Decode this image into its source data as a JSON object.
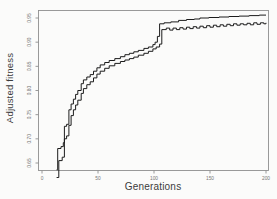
{
  "figure": {
    "xlabel": "Generations",
    "ylabel": "Adjusted fitness"
  },
  "chart_data": {
    "type": "line",
    "title": "",
    "xlabel": "Generations",
    "ylabel": "Adjusted fitness",
    "xlim": [
      0,
      200
    ],
    "ylim": [
      0.62,
      0.97
    ],
    "x_ticks": [
      "0",
      "50",
      "100",
      "150",
      "200"
    ],
    "y_ticks": [
      "0.65",
      "0.70",
      "0.75",
      "0.80",
      "0.85",
      "0.90",
      "0.95"
    ],
    "grid": false,
    "legend_position": "none",
    "interpolation": "step-after",
    "line_color": "#1c1c1c",
    "box_color": "#8f8f8f",
    "tick_label_color": "#777777",
    "series": [
      {
        "name": "best-fitness",
        "points": [
          [
            13,
            0.636
          ],
          [
            14,
            0.68
          ],
          [
            17,
            0.684
          ],
          [
            19,
            0.692
          ],
          [
            20,
            0.726
          ],
          [
            22,
            0.73
          ],
          [
            24,
            0.76
          ],
          [
            26,
            0.772
          ],
          [
            28,
            0.782
          ],
          [
            30,
            0.792
          ],
          [
            32,
            0.8
          ],
          [
            35,
            0.814
          ],
          [
            37,
            0.822
          ],
          [
            40,
            0.828
          ],
          [
            43,
            0.833
          ],
          [
            46,
            0.84
          ],
          [
            49,
            0.847
          ],
          [
            52,
            0.853
          ],
          [
            56,
            0.858
          ],
          [
            60,
            0.862
          ],
          [
            65,
            0.866
          ],
          [
            70,
            0.87
          ],
          [
            74,
            0.874
          ],
          [
            78,
            0.877
          ],
          [
            82,
            0.88
          ],
          [
            86,
            0.883
          ],
          [
            91,
            0.887
          ],
          [
            95,
            0.89
          ],
          [
            99,
            0.895
          ],
          [
            101,
            0.9
          ],
          [
            103,
            0.912
          ],
          [
            105,
            0.938
          ],
          [
            109,
            0.94
          ],
          [
            115,
            0.942
          ],
          [
            122,
            0.945
          ],
          [
            129,
            0.947
          ],
          [
            136,
            0.948
          ],
          [
            141,
            0.95
          ],
          [
            149,
            0.951
          ],
          [
            158,
            0.952
          ],
          [
            167,
            0.953
          ],
          [
            176,
            0.954
          ],
          [
            185,
            0.955
          ],
          [
            194,
            0.956
          ],
          [
            200,
            0.956
          ]
        ]
      },
      {
        "name": "mean-fitness",
        "points": [
          [
            13,
            0.62
          ],
          [
            15,
            0.655
          ],
          [
            18,
            0.662
          ],
          [
            20,
            0.7
          ],
          [
            22,
            0.706
          ],
          [
            24,
            0.728
          ],
          [
            26,
            0.748
          ],
          [
            28,
            0.76
          ],
          [
            30,
            0.77
          ],
          [
            32,
            0.78
          ],
          [
            35,
            0.794
          ],
          [
            37,
            0.804
          ],
          [
            40,
            0.812
          ],
          [
            43,
            0.818
          ],
          [
            46,
            0.826
          ],
          [
            49,
            0.834
          ],
          [
            52,
            0.84
          ],
          [
            56,
            0.846
          ],
          [
            60,
            0.851
          ],
          [
            65,
            0.856
          ],
          [
            70,
            0.86
          ],
          [
            74,
            0.863
          ],
          [
            78,
            0.866
          ],
          [
            82,
            0.869
          ],
          [
            86,
            0.873
          ],
          [
            91,
            0.877
          ],
          [
            95,
            0.881
          ],
          [
            99,
            0.886
          ],
          [
            102,
            0.89
          ],
          [
            105,
            0.896
          ],
          [
            107,
            0.926
          ],
          [
            111,
            0.929
          ],
          [
            114,
            0.925
          ],
          [
            117,
            0.929
          ],
          [
            120,
            0.926
          ],
          [
            123,
            0.93
          ],
          [
            126,
            0.927
          ],
          [
            129,
            0.931
          ],
          [
            132,
            0.928
          ],
          [
            135,
            0.932
          ],
          [
            138,
            0.929
          ],
          [
            141,
            0.933
          ],
          [
            144,
            0.93
          ],
          [
            147,
            0.934
          ],
          [
            150,
            0.931
          ],
          [
            153,
            0.935
          ],
          [
            156,
            0.932
          ],
          [
            159,
            0.936
          ],
          [
            162,
            0.933
          ],
          [
            165,
            0.937
          ],
          [
            168,
            0.934
          ],
          [
            171,
            0.938
          ],
          [
            174,
            0.935
          ],
          [
            177,
            0.938
          ],
          [
            180,
            0.936
          ],
          [
            183,
            0.939
          ],
          [
            186,
            0.936
          ],
          [
            189,
            0.94
          ],
          [
            192,
            0.937
          ],
          [
            195,
            0.94
          ],
          [
            198,
            0.938
          ],
          [
            200,
            0.94
          ]
        ]
      }
    ]
  }
}
